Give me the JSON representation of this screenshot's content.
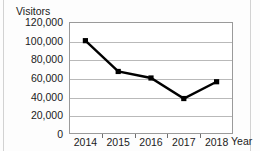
{
  "chart_data": {
    "type": "line",
    "title": "",
    "ylabel": "Visitors",
    "xlabel": "Year",
    "categories": [
      "2014",
      "2015",
      "2016",
      "2017",
      "2018"
    ],
    "values": [
      100000,
      67000,
      60000,
      38000,
      56000
    ],
    "series": [
      {
        "name": "Visitors",
        "values": [
          100000,
          67000,
          60000,
          38000,
          56000
        ]
      }
    ],
    "ylim": [
      0,
      120000
    ],
    "ytick_labels": [
      "120,000",
      "100,000",
      "80,000",
      "60,000",
      "40,000",
      "20,000",
      "0"
    ],
    "ytick_values": [
      120000,
      100000,
      80000,
      60000,
      40000,
      20000,
      0
    ],
    "grid": true,
    "legend": "none",
    "marker": "square",
    "line_color": "#000000",
    "marker_color": "#000000",
    "grid_color": "#b9b9b9",
    "frame_color": "#9a9a9a"
  }
}
